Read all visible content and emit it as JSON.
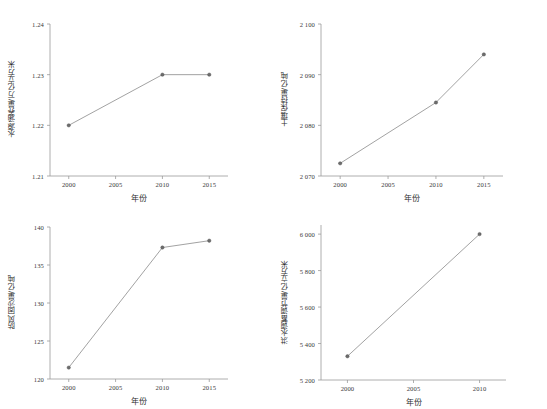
{
  "figure": {
    "background": "#ffffff",
    "line_color": "#8a8a8a",
    "marker_color": "#6d6d6d",
    "axis_color": "#9b9b9b"
  },
  "chart_data": [
    {
      "type": "line",
      "id": "water-conservation",
      "title": "",
      "xlabel": "年份",
      "ylabel": "水源涵养量/万亿立方米",
      "x": [
        2000,
        2010,
        2015
      ],
      "values": [
        1.22,
        1.23,
        1.23
      ],
      "categories": [
        "2000",
        "2010",
        "2015"
      ],
      "xticks": [
        "2000",
        "2005",
        "2010",
        "2015"
      ],
      "xtick_values": [
        2000,
        2005,
        2010,
        2015
      ],
      "yticks": [
        "1.21",
        "1.22",
        "1.23",
        "1.24"
      ],
      "ytick_values": [
        1.21,
        1.22,
        1.23,
        1.24
      ],
      "xlim": [
        1998,
        2017
      ],
      "ylim": [
        1.21,
        1.24
      ],
      "grid": false,
      "legend": "none"
    },
    {
      "type": "line",
      "id": "soil-retention",
      "title": "",
      "xlabel": "年份",
      "ylabel": "土壤保持量/亿吨",
      "x": [
        2000,
        2010,
        2015
      ],
      "values": [
        2072.5,
        2084.5,
        2094.0
      ],
      "categories": [
        "2000",
        "2010",
        "2015"
      ],
      "xticks": [
        "2000",
        "2005",
        "2010",
        "2015"
      ],
      "xtick_values": [
        2000,
        2005,
        2010,
        2015
      ],
      "yticks": [
        "2 070",
        "2 080",
        "2 090",
        "2 100"
      ],
      "ytick_values": [
        2070,
        2080,
        2090,
        2100
      ],
      "xlim": [
        1998,
        2017
      ],
      "ylim": [
        2070,
        2100
      ],
      "grid": false,
      "legend": "none"
    },
    {
      "type": "line",
      "id": "windbreak-sand-fixation",
      "title": "",
      "xlabel": "年份",
      "ylabel": "防风固沙量/亿吨",
      "x": [
        2000,
        2010,
        2015
      ],
      "values": [
        121.5,
        137.3,
        138.2
      ],
      "categories": [
        "2000",
        "2010",
        "2015"
      ],
      "xticks": [
        "2000",
        "2005",
        "2010",
        "2015"
      ],
      "xtick_values": [
        2000,
        2005,
        2010,
        2015
      ],
      "yticks": [
        "120",
        "125",
        "130",
        "135",
        "140"
      ],
      "ytick_values": [
        120,
        125,
        130,
        135,
        140
      ],
      "xlim": [
        1998,
        2017
      ],
      "ylim": [
        120,
        140
      ],
      "grid": false,
      "legend": "none"
    },
    {
      "type": "line",
      "id": "flood-regulation",
      "title": "",
      "xlabel": "年份",
      "ylabel": "洪水调蓄调节量/亿立方米",
      "x": [
        2000,
        2010
      ],
      "values": [
        5330,
        6000
      ],
      "categories": [
        "2000",
        "2010"
      ],
      "xticks": [
        "2000",
        "2005",
        "2010"
      ],
      "xtick_values": [
        2000,
        2005,
        2010
      ],
      "yticks": [
        "5 200",
        "5 400",
        "5 600",
        "5 800",
        "6 000"
      ],
      "ytick_values": [
        5200,
        5400,
        5600,
        5800,
        6000
      ],
      "xlim": [
        1998,
        2012
      ],
      "ylim": [
        5200,
        6050
      ],
      "grid": false,
      "legend": "none"
    }
  ]
}
